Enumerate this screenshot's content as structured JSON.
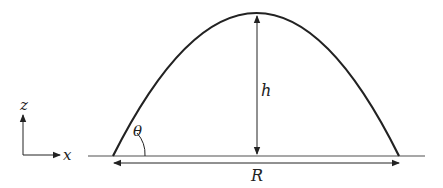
{
  "diagram": {
    "labels": {
      "height": "h",
      "range": "R",
      "angle": "θ",
      "x_axis": "x",
      "z_axis": "z"
    },
    "colors": {
      "trajectory": "#222222",
      "ground": "#8a8a8a",
      "arrows": "#222222",
      "background": "#ffffff"
    }
  }
}
